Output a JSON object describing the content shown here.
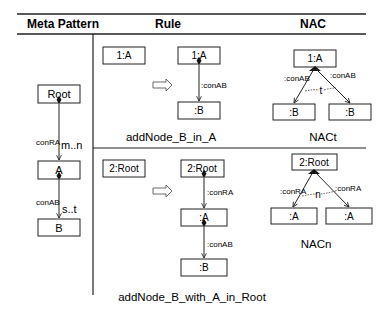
{
  "header": {
    "col1": "Meta Pattern",
    "col2": "Rule",
    "col3": "NAC"
  },
  "meta_pattern": {
    "nodes": {
      "root": "Root",
      "a": "A",
      "b": "B"
    },
    "edges": {
      "root_a": {
        "label": "conRA",
        "multiplicity": "m..n"
      },
      "a_b": {
        "label": "conAB",
        "multiplicity": "s..t"
      }
    }
  },
  "rule1": {
    "lhs_node": "1:A",
    "rhs_nodes": {
      "a": "1:A",
      "b": ":B"
    },
    "rhs_edge": ":conAB",
    "caption": "addNode_B_in_A"
  },
  "nac1": {
    "nodes": {
      "a": "1:A",
      "b1": ":B",
      "b2": ":B"
    },
    "edges": {
      "left": ":conAB",
      "right": ":conAB"
    },
    "count_label": "t",
    "caption": "NACt"
  },
  "rule2": {
    "lhs_node": "2:Root",
    "rhs_nodes": {
      "root": "2:Root",
      "a": ":A",
      "b": ":B"
    },
    "rhs_edges": {
      "root_a": ":conRA",
      "a_b": ":conAB"
    },
    "caption": "addNode_B_with_A_in_Root"
  },
  "nac2": {
    "nodes": {
      "root": "2:Root",
      "a1": ":A",
      "a2": ":A"
    },
    "edges": {
      "left": ":conRA",
      "right": ":conRA"
    },
    "count_label": "n",
    "caption": "NACn"
  }
}
